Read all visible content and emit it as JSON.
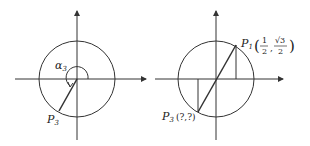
{
  "figures": [
    {
      "id": "left",
      "description": "Unit circle with terminal side of angle alpha3 in the third quadrant",
      "angle_label": "α",
      "angle_sub": "3",
      "point_label": "P",
      "point_sub": "3"
    },
    {
      "id": "right",
      "description": "Unit circle showing P1 and its point-symmetric P3 through origin",
      "p1_label": "P",
      "p1_sub": "1",
      "p1_coords": {
        "x_num": "1",
        "x_den": "2",
        "y_num": "√3",
        "y_den": "2"
      },
      "p3_label": "P",
      "p3_sub": "3",
      "p3_coords": "(?,?)"
    }
  ],
  "colors": {
    "stroke": "#333333",
    "text": "#222222",
    "background": "#ffffff"
  }
}
